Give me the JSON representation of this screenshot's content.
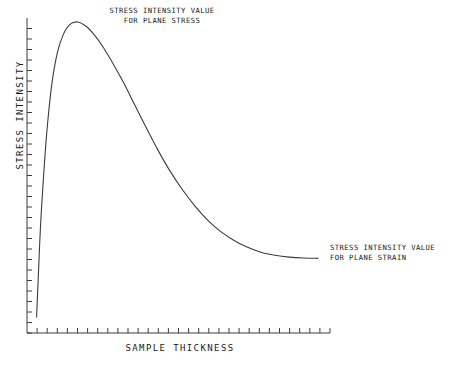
{
  "chart_data": {
    "type": "line",
    "title": "",
    "xlabel": "SAMPLE THICKNESS",
    "ylabel": "STRESS INTENSITY",
    "grid": false,
    "legend_position": "none",
    "axis_ticks_labeled": false,
    "xlim": [
      0,
      1
    ],
    "ylim": [
      0,
      1
    ],
    "annotations": [
      {
        "name": "plane-stress",
        "line1": "STRESS INTENSITY VALUE",
        "line2": "FOR PLANE STRESS",
        "points_to": "curve peak",
        "x": 0.16,
        "y": 1.0
      },
      {
        "name": "plane-strain",
        "line1": "STRESS INTENSITY VALUE",
        "line2": "FOR PLANE STRAIN",
        "points_to": "curve asymptote",
        "x": 0.96,
        "y": 0.22
      }
    ],
    "series": [
      {
        "name": "stress-intensity-vs-thickness",
        "color": "#3c3c3c",
        "x": [
          0.016,
          0.022,
          0.03,
          0.041,
          0.054,
          0.07,
          0.089,
          0.11,
          0.133,
          0.16,
          0.19,
          0.22,
          0.25,
          0.285,
          0.32,
          0.36,
          0.4,
          0.44,
          0.48,
          0.525,
          0.57,
          0.615,
          0.66,
          0.705,
          0.75,
          0.8,
          0.85,
          0.9,
          0.95,
          1.0
        ],
        "y": [
          0.026,
          0.16,
          0.33,
          0.5,
          0.66,
          0.8,
          0.9,
          0.96,
          0.992,
          1.0,
          0.985,
          0.955,
          0.915,
          0.86,
          0.8,
          0.725,
          0.65,
          0.578,
          0.512,
          0.448,
          0.392,
          0.345,
          0.308,
          0.28,
          0.258,
          0.24,
          0.23,
          0.224,
          0.221,
          0.22
        ]
      }
    ]
  },
  "axes": {
    "x_tick_count": 30,
    "y_tick_count": 30,
    "axis_color": "#3c3c3c"
  },
  "colors": {
    "background": "#ffffff",
    "ink": "#1a1a1a",
    "curve": "#3c3c3c"
  }
}
